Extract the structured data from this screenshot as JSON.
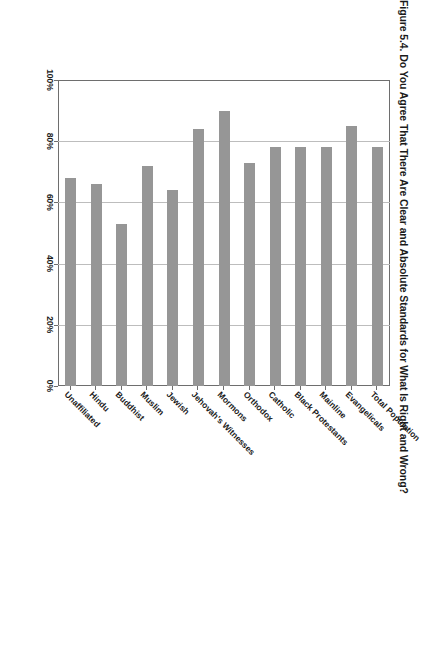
{
  "figure": {
    "title": "Figure 5.4. Do You Agree That There Are Clear and Absolute Standards for What Is Right and Wrong?",
    "bar_color": "#969696",
    "frame_color": "#6e6e6e",
    "grid_color": "#bdbdbd"
  },
  "chart_data": {
    "type": "bar",
    "orientation": "horizontal",
    "title": "Figure 5.4. Do You Agree That There Are Clear and Absolute Standards for What Is Right and Wrong?",
    "xlabel": "",
    "ylabel": "",
    "xlim": [
      0,
      100
    ],
    "grid": true,
    "legend": false,
    "tick_labels": [
      "0%",
      "20%",
      "40%",
      "60%",
      "80%",
      "100%"
    ],
    "tick_values": [
      0,
      20,
      40,
      60,
      80,
      100
    ],
    "categories": [
      "Total Population",
      "Evangelicals",
      "Mainline",
      "Black Protestants",
      "Catholic",
      "Orthodox",
      "Mormons",
      "Jehovah's Witnesses",
      "Jewish",
      "Muslim",
      "Buddhist",
      "Hindu",
      "Unaffiliated"
    ],
    "values": [
      78,
      85,
      78,
      78,
      78,
      73,
      90,
      84,
      64,
      72,
      53,
      66,
      68
    ],
    "series": [
      {
        "name": "Agree there are clear and absolute standards",
        "values": [
          78,
          85,
          78,
          78,
          78,
          73,
          90,
          84,
          64,
          72,
          53,
          66,
          68
        ]
      }
    ]
  }
}
